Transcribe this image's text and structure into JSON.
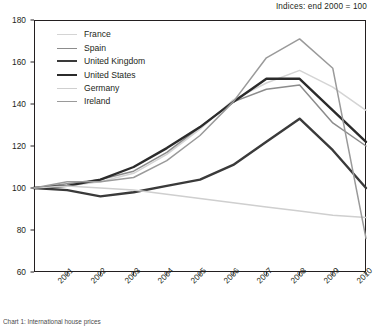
{
  "annotation": "Indices:  end 2000 = 100",
  "caption": "Chart 1: International house prices",
  "axes": {
    "y_ticks": [
      60,
      80,
      100,
      120,
      140,
      160,
      180
    ],
    "x_ticks": [
      "2001",
      "2002",
      "2003",
      "2004",
      "2005",
      "2006",
      "2007",
      "2008",
      "2009",
      "2010"
    ],
    "ylim": [
      60,
      180
    ],
    "xlim": [
      2000,
      2010
    ]
  },
  "legend": [
    {
      "label": "France",
      "color": "#d4d4d4",
      "width": 1.5
    },
    {
      "label": "Spain",
      "color": "#8c8c8c",
      "width": 1.5
    },
    {
      "label": "United Kingdom",
      "color": "#3a3a3a",
      "width": 2.4
    },
    {
      "label": "United States",
      "color": "#2b2b2b",
      "width": 2.4
    },
    {
      "label": "Germany",
      "color": "#cfcfcf",
      "width": 1.5
    },
    {
      "label": "Ireland",
      "color": "#9a9a9a",
      "width": 1.5
    }
  ],
  "chart_data": {
    "type": "line",
    "title": "",
    "subtitle": "Indices:  end 2000 = 100",
    "xlabel": "",
    "ylabel": "",
    "ylim": [
      60,
      180
    ],
    "grid": false,
    "legend_position": "upper-left inside",
    "x": [
      2000,
      2001,
      2002,
      2003,
      2004,
      2005,
      2006,
      2007,
      2008,
      2009,
      2010
    ],
    "series": [
      {
        "name": "France",
        "color": "#d4d4d4",
        "values": [
          100,
          101,
          103,
          107,
          116,
          128,
          142,
          150,
          156,
          148,
          137
        ]
      },
      {
        "name": "Spain",
        "color": "#8c8c8c",
        "values": [
          100,
          102,
          104,
          108,
          117,
          129,
          141,
          147,
          149,
          131,
          120
        ]
      },
      {
        "name": "United Kingdom",
        "color": "#3a3a3a",
        "values": [
          100,
          99,
          96,
          98,
          101,
          104,
          111,
          122,
          133,
          118,
          100
        ]
      },
      {
        "name": "United States",
        "color": "#2b2b2b",
        "values": [
          100,
          101,
          104,
          110,
          119,
          129,
          141,
          152,
          152,
          137,
          122
        ]
      },
      {
        "name": "Germany",
        "color": "#cfcfcf",
        "values": [
          100,
          101,
          100,
          99,
          97,
          95,
          93,
          91,
          89,
          87,
          86
        ]
      },
      {
        "name": "Ireland",
        "color": "#9a9a9a",
        "values": [
          100,
          103,
          103,
          105,
          113,
          125,
          141,
          162,
          171,
          157,
          76
        ]
      }
    ],
    "annotations": [
      {
        "text": "Indices:  end 2000 = 100",
        "position": "top-right"
      }
    ]
  }
}
